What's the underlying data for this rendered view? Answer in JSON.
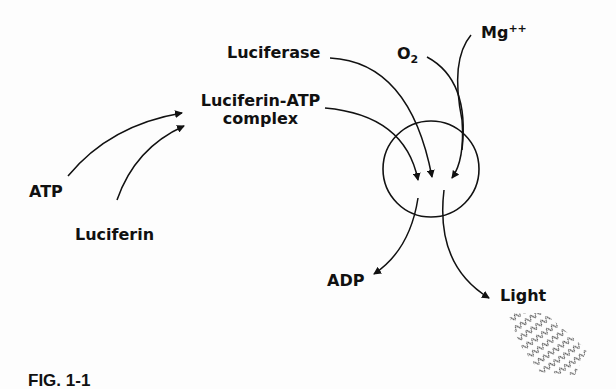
{
  "figure": {
    "caption": "FIG. 1-1",
    "labels": {
      "luciferase": "Luciferase",
      "complex_line1": "Luciferin-ATP",
      "complex_line2": "complex",
      "atp": "ATP",
      "luciferin": "Luciferin",
      "o2_base": "O",
      "o2_sub": "2",
      "mg_base": "Mg",
      "mg_sup": "++",
      "adp": "ADP",
      "light": "Light"
    },
    "reactions": [
      {
        "from": "ATP",
        "to": "Luciferin-ATP complex"
      },
      {
        "from": "Luciferin",
        "to": "Luciferin-ATP complex"
      },
      {
        "from": "Luciferin-ATP complex",
        "to": "reaction circle"
      },
      {
        "from": "Luciferase",
        "to": "reaction circle"
      },
      {
        "from": "O2",
        "to": "reaction circle"
      },
      {
        "from": "Mg++",
        "to": "reaction circle"
      },
      {
        "from": "reaction circle",
        "to": "ADP"
      },
      {
        "from": "reaction circle",
        "to": "Light"
      }
    ],
    "colors": {
      "ink": "#111111",
      "background": "#fdfdfd"
    }
  }
}
